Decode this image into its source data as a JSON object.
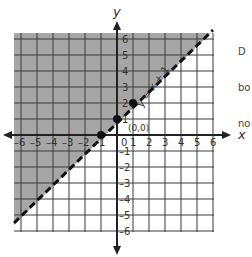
{
  "chart_data": {
    "type": "inequality-graph",
    "title": "",
    "inequality": "y > x + 1",
    "boundary_line": {
      "label": "y = x + 1",
      "style": "dashed",
      "slope": 1,
      "intercept": 1
    },
    "shaded_region": "above line (upper-left)",
    "points": [
      {
        "x": -1,
        "y": 0
      },
      {
        "x": 0,
        "y": 1
      },
      {
        "x": 1,
        "y": 2
      }
    ],
    "test_point": {
      "label": "(0,0)",
      "x": 0,
      "y": 0
    },
    "xlabel": "x",
    "ylabel": "y",
    "xlim": [
      -6,
      6
    ],
    "ylim": [
      -6,
      6
    ],
    "x_ticks": [
      "-6",
      "-5",
      "-4",
      "-3",
      "-2",
      "-1",
      "0",
      "1",
      "2",
      "3",
      "4",
      "5",
      "6"
    ],
    "y_ticks": [
      "6",
      "5",
      "4",
      "3",
      "2",
      "1",
      "-1",
      "-2",
      "-3",
      "-4",
      "-5",
      "-6"
    ],
    "grid": true
  },
  "labels": {
    "x_axis": "x",
    "y_axis": "y",
    "line_label": "y = x + 1",
    "origin_label": "(0,0)",
    "zero": "0"
  },
  "side_text": {
    "line1": "D",
    "line2": "bo",
    "line3": "no"
  },
  "colors": {
    "shade": "#a6a6a6",
    "grid": "#333333",
    "axis": "#222222",
    "text": "#333333"
  }
}
